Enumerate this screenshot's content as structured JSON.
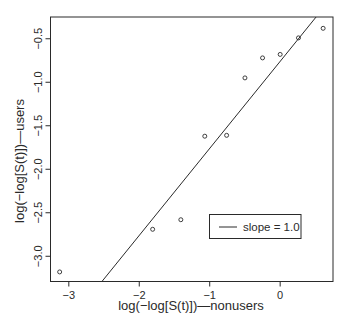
{
  "chart_data": {
    "type": "scatter",
    "title": "",
    "xlabel": "log(−log[S(t)])—nonusers",
    "ylabel": "log(−log[S(t)])—users",
    "xlim": [
      -3.26,
      0.75
    ],
    "ylim": [
      -3.29,
      -0.25
    ],
    "xticks": [
      -3,
      -2,
      -1,
      0
    ],
    "xtick_labels": [
      "−3",
      "−2",
      "−1",
      "0"
    ],
    "yticks": [
      -0.5,
      -1.0,
      -1.5,
      -2.0,
      -2.5,
      -3.0
    ],
    "ytick_labels": [
      "−0.5",
      "−1.0",
      "−1.5",
      "−2.0",
      "−2.5",
      "−3.0"
    ],
    "grid": false,
    "series": [
      {
        "name": "observed",
        "marker": "open-circle",
        "x": [
          -3.13,
          -1.81,
          -1.41,
          -1.07,
          -0.76,
          -0.5,
          -0.25,
          0.0,
          0.26,
          0.61
        ],
        "y": [
          -3.18,
          -2.69,
          -2.58,
          -1.62,
          -1.61,
          -0.95,
          -0.72,
          -0.68,
          -0.49,
          -0.38
        ]
      }
    ],
    "reference_line": {
      "name": "slope = 1.0",
      "slope": 1.0,
      "intercept": -0.76
    },
    "legend": {
      "entries": [
        "slope = 1.0"
      ],
      "placement": "lower-right"
    },
    "colors": {
      "ink": "#2a2a2a",
      "background": "#ffffff"
    }
  }
}
